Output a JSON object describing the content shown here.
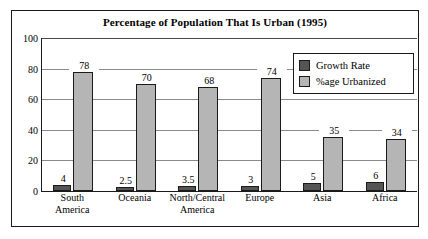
{
  "chart_data": {
    "type": "bar",
    "title": "Percentage of Population That Is Urban (1995)",
    "xlabel": "",
    "ylabel": "",
    "ylim": [
      0,
      100
    ],
    "yticks": [
      0,
      20,
      40,
      60,
      80,
      100
    ],
    "grid": true,
    "legend_position": "top-right",
    "categories": [
      "South America",
      "Oceania",
      "North/Central America",
      "Europe",
      "Asia",
      "Africa"
    ],
    "series": [
      {
        "name": "Growth Rate",
        "color": "#555555",
        "values": [
          4,
          2.5,
          3.5,
          3,
          5,
          6
        ],
        "labels": [
          "4",
          "2.5",
          "3.5",
          "3",
          "5",
          "6"
        ]
      },
      {
        "name": "%age Urbanized",
        "color": "#b5b5b5",
        "values": [
          78,
          70,
          68,
          74,
          35,
          34
        ],
        "labels": [
          "78",
          "70",
          "68",
          "74",
          "35",
          "34"
        ]
      }
    ]
  },
  "axis": {
    "ytick_labels": [
      "100",
      "80",
      "60",
      "40",
      "20",
      "0"
    ]
  },
  "legend": {
    "items": [
      {
        "label": "Growth Rate"
      },
      {
        "label": "%age Urbanized"
      }
    ]
  },
  "xaxis": {
    "labels": [
      {
        "line1": "South",
        "line2": "America"
      },
      {
        "line1": "Oceania",
        "line2": ""
      },
      {
        "line1": "North/Central",
        "line2": "America"
      },
      {
        "line1": "Europe",
        "line2": ""
      },
      {
        "line1": "Asia",
        "line2": ""
      },
      {
        "line1": "Africa",
        "line2": ""
      }
    ]
  }
}
